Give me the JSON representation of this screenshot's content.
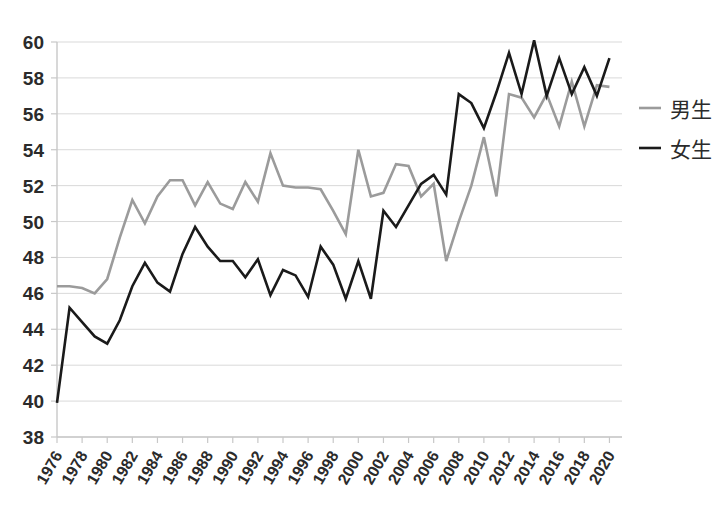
{
  "chart_data": {
    "type": "line",
    "title": "",
    "xlabel": "",
    "ylabel": "",
    "ylim": [
      38,
      60
    ],
    "xlim": [
      1976,
      2021
    ],
    "grid": true,
    "legend_position": "right",
    "ytick_labels": [
      "38",
      "40",
      "42",
      "44",
      "46",
      "48",
      "50",
      "52",
      "54",
      "56",
      "58",
      "60"
    ],
    "ytick_values": [
      38,
      40,
      42,
      44,
      46,
      48,
      50,
      52,
      54,
      56,
      58,
      60
    ],
    "xtick_labels": [
      "1976",
      "1978",
      "1980",
      "1982",
      "1984",
      "1986",
      "1988",
      "1990",
      "1992",
      "1994",
      "1996",
      "1998",
      "2000",
      "2002",
      "2004",
      "2006",
      "2008",
      "2010",
      "2012",
      "2014",
      "2016",
      "2018",
      "2020"
    ],
    "xtick_values": [
      1976,
      1978,
      1980,
      1982,
      1984,
      1986,
      1988,
      1990,
      1992,
      1994,
      1996,
      1998,
      2000,
      2002,
      2004,
      2006,
      2008,
      2010,
      2012,
      2014,
      2016,
      2018,
      2020
    ],
    "x": [
      1976,
      1977,
      1978,
      1979,
      1980,
      1981,
      1982,
      1983,
      1984,
      1985,
      1986,
      1987,
      1988,
      1989,
      1990,
      1991,
      1992,
      1993,
      1994,
      1995,
      1996,
      1997,
      1998,
      1999,
      2000,
      2001,
      2002,
      2003,
      2004,
      2005,
      2006,
      2007,
      2008,
      2009,
      2010,
      2011,
      2012,
      2013,
      2014,
      2015,
      2016,
      2017,
      2018,
      2019,
      2020
    ],
    "series": [
      {
        "name": "男生",
        "color": "#9b9b9b",
        "values": [
          46.4,
          46.4,
          46.3,
          46.0,
          46.8,
          49.1,
          51.2,
          49.9,
          51.4,
          52.3,
          52.3,
          50.9,
          52.2,
          51.0,
          50.7,
          52.2,
          51.1,
          53.8,
          52.0,
          51.9,
          51.9,
          51.8,
          50.6,
          49.3,
          54.0,
          51.4,
          51.6,
          53.2,
          53.1,
          51.4,
          52.1,
          47.8,
          50.0,
          52.0,
          54.7,
          51.4,
          57.1,
          56.9,
          55.8,
          57.1,
          55.3,
          57.8,
          55.3,
          57.6,
          57.5
        ]
      },
      {
        "name": "女生",
        "color": "#1a1a1a",
        "values": [
          39.9,
          45.2,
          44.4,
          43.6,
          43.2,
          44.5,
          46.4,
          47.7,
          46.6,
          46.1,
          48.2,
          49.7,
          48.6,
          47.8,
          47.8,
          46.9,
          47.9,
          45.9,
          47.3,
          47.0,
          45.8,
          48.6,
          47.6,
          45.7,
          47.8,
          45.7,
          50.6,
          49.7,
          50.9,
          52.1,
          52.6,
          51.5,
          57.1,
          56.6,
          55.2,
          57.2,
          59.4,
          57.1,
          60.1,
          57.0,
          59.1,
          57.1,
          58.6,
          57.0,
          59.1
        ]
      }
    ]
  },
  "legend": {
    "items": [
      {
        "label": "男生",
        "color": "#9b9b9b"
      },
      {
        "label": "女生",
        "color": "#1a1a1a"
      }
    ]
  }
}
